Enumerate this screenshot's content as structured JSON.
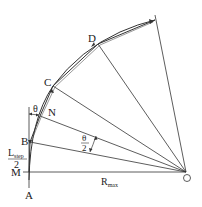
{
  "diagram": {
    "points": {
      "A": "A",
      "M": "M",
      "B": "B",
      "N": "N",
      "C": "C",
      "D": "D",
      "O": "O"
    },
    "labels": {
      "theta": "θ",
      "half_theta_num": "θ",
      "half_theta_den": "2",
      "lstep_main": "L",
      "lstep_sub": "step",
      "lstep_den": "2",
      "rmax_main": "R",
      "rmax_sub": "max"
    },
    "colors": {
      "line": "#333333",
      "background": "#ffffff"
    }
  }
}
